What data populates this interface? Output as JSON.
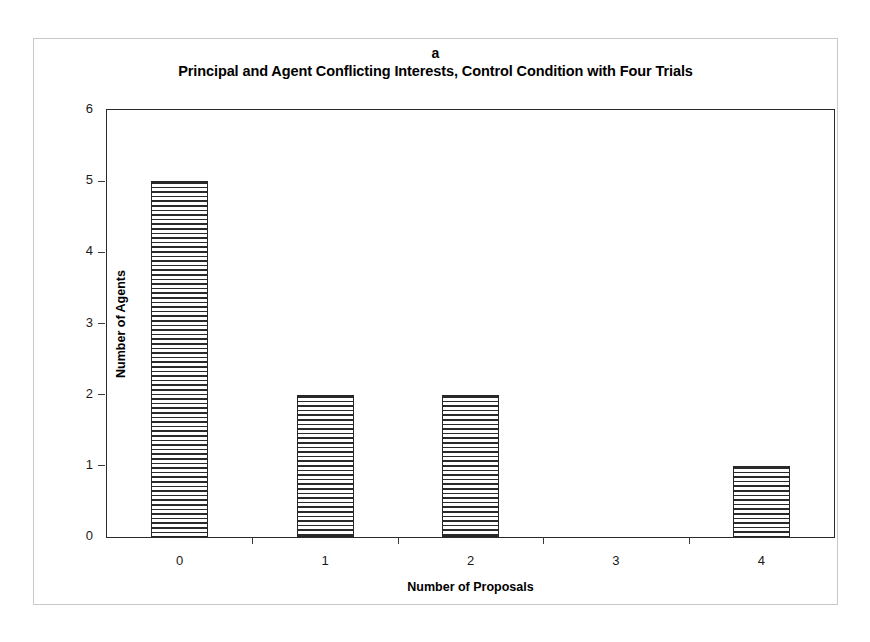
{
  "figure": {
    "panel_label": "a",
    "title": "Principal and Agent Conflicting Interests, Control Condition with Four Trials"
  },
  "chart_data": {
    "type": "bar",
    "title": "Principal and Agent Conflicting Interests, Control Condition with Four Trials",
    "panel": "a",
    "categories": [
      "0",
      "1",
      "2",
      "3",
      "4"
    ],
    "values": [
      5,
      2,
      2,
      0,
      1
    ],
    "series": [
      {
        "name": "Number of Agents",
        "values": [
          5,
          2,
          2,
          0,
          1
        ]
      }
    ],
    "xlabel": "Number of Proposals",
    "ylabel": "Number of Agents",
    "ylim": [
      0,
      6
    ],
    "yticks": [
      "0",
      "1",
      "2",
      "3",
      "4",
      "5",
      "6"
    ],
    "ytick_values": [
      0,
      1,
      2,
      3,
      4,
      5,
      6
    ],
    "grid": false,
    "legend": false,
    "bar_fill": "horizontal-hatch",
    "bar_edge_color": "#262626",
    "bar_fill_color": "#ffffff",
    "hatch_color": "#2a2a2a",
    "axis_color": "#2b2b2b",
    "frame_color": "#c9c9c9",
    "background_color": "#ffffff"
  }
}
